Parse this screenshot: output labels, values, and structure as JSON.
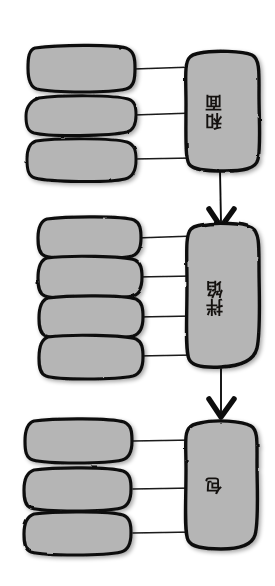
{
  "diagram": {
    "title": "和面 拌馅 包",
    "orientation": "rotated-90",
    "style": "hand-drawn sketch flowchart",
    "background_color": "#ffffff",
    "box_fill_color": "#b5b5b5",
    "box_stroke_color": "#111111",
    "connector_color": "#1a1a1a"
  },
  "stages": [
    {
      "id": "stage-he-mian",
      "label": "和面",
      "blank_boxes": 3,
      "boxes": [
        {
          "id": "he-mian-item-1",
          "label": ""
        },
        {
          "id": "he-mian-item-2",
          "label": ""
        },
        {
          "id": "he-mian-item-3",
          "label": ""
        }
      ]
    },
    {
      "id": "stage-ban-xian",
      "label": "拌馅",
      "blank_boxes": 4,
      "boxes": [
        {
          "id": "ban-xian-item-1",
          "label": ""
        },
        {
          "id": "ban-xian-item-2",
          "label": ""
        },
        {
          "id": "ban-xian-item-3",
          "label": ""
        },
        {
          "id": "ban-xian-item-4",
          "label": ""
        }
      ]
    },
    {
      "id": "stage-bao",
      "label": "包",
      "blank_boxes": 3,
      "boxes": [
        {
          "id": "bao-item-1",
          "label": ""
        },
        {
          "id": "bao-item-2",
          "label": ""
        },
        {
          "id": "bao-item-3",
          "label": ""
        }
      ]
    }
  ],
  "flow_arrows": [
    {
      "id": "arrow-he-mian-to-ban-xian",
      "from": "stage-he-mian",
      "to": "stage-ban-xian"
    },
    {
      "id": "arrow-ban-xian-to-bao",
      "from": "stage-ban-xian",
      "to": "stage-bao"
    }
  ]
}
